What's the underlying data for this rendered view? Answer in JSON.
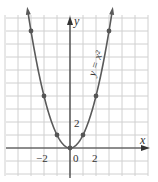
{
  "chart_data": {
    "type": "line",
    "title": "",
    "xlabel": "x",
    "ylabel": "y",
    "series": [
      {
        "name": "y = x^2",
        "label": "y = x²",
        "x": [
          -3,
          -2,
          -1,
          0,
          1,
          2,
          3
        ],
        "values": [
          9,
          4,
          1,
          0,
          1,
          4,
          9
        ]
      }
    ],
    "x_tick_labels": [
      {
        "value": -2,
        "label": "−2"
      },
      {
        "value": 0,
        "label": "0"
      },
      {
        "value": 2,
        "label": "2"
      }
    ],
    "y_tick_labels": [
      {
        "value": 2,
        "label": "2"
      }
    ],
    "xlim": [
      -5,
      6
    ],
    "ylim": [
      -2,
      10
    ],
    "grid": true,
    "grid_step": 1,
    "legend": "none",
    "annotations": [
      {
        "text": "y = x²",
        "position": "along right branch"
      }
    ],
    "colors": {
      "curve": "#5a5a5a",
      "grid": "#d0d0d0",
      "axis": "#333333"
    }
  }
}
